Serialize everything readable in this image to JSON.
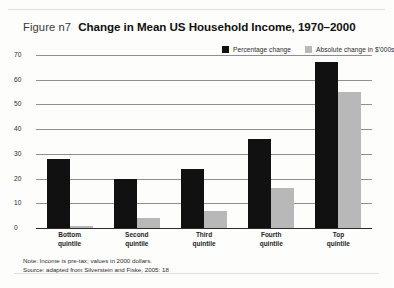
{
  "figure": {
    "number_label": "Figure n7",
    "title": "Change in Mean US Household Income, 1970–2000"
  },
  "notes": {
    "note": "Note: Income is pre-tax; values in 2000 dollars.",
    "source": "Source: adapted from Silverstein and Fiske, 2005: 18"
  },
  "colors": {
    "percentage_change": "#111111",
    "absolute_change": "#b8b8b8",
    "gridline": "#8f8f8f",
    "page_background": "#fdfdfc"
  },
  "chart_data": {
    "type": "bar",
    "title": "Change in Mean US Household Income, 1970–2000",
    "xlabel": "",
    "ylabel": "",
    "ylim": [
      0,
      70
    ],
    "yticks": [
      0,
      10,
      20,
      30,
      40,
      50,
      60,
      70
    ],
    "grid": true,
    "legend_position": "top-right",
    "categories": [
      "Bottom quintile",
      "Second quintile",
      "Third quintile",
      "Fourth quintile",
      "Top quintile"
    ],
    "category_lines": [
      [
        "Bottom",
        "quintile"
      ],
      [
        "Second",
        "quintile"
      ],
      [
        "Third",
        "quintile"
      ],
      [
        "Fourth",
        "quintile"
      ],
      [
        "Top",
        "quintile"
      ]
    ],
    "series": [
      {
        "name": "Percentage change",
        "color": "#111111",
        "values": [
          28,
          20,
          24,
          36,
          67
        ]
      },
      {
        "name": "Absolute change in $'000s",
        "color": "#b8b8b8",
        "values": [
          1,
          4,
          7,
          16,
          55
        ]
      }
    ]
  }
}
